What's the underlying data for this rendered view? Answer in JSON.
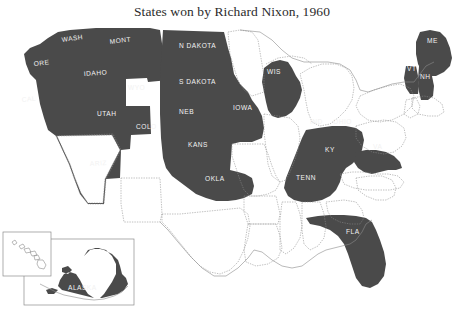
{
  "figure": {
    "title": "States won by Richard Nixon, 1960",
    "background_color": "#ffffff",
    "won_fill_color": "#4a4a4a",
    "lost_fill_color": "#ffffff",
    "border_color": "#8c8c8c",
    "label_color": "#f2f2f2",
    "title_color": "#2b2b2b"
  },
  "map": {
    "type": "choropleth-categorical",
    "subject": "United States presidential election 1960",
    "candidate": "Richard Nixon",
    "year": "1960",
    "legend_shown": false,
    "states_won_labels": [
      {
        "id": "WA",
        "label": "WASH",
        "x": 78,
        "y": 38
      },
      {
        "id": "MT",
        "label": "MONT",
        "x": 128,
        "y": 40
      },
      {
        "id": "OR",
        "label": "ORE",
        "x": 47,
        "y": 64
      },
      {
        "id": "ID",
        "label": "IDAHO",
        "x": 101,
        "y": 74
      },
      {
        "id": "ND",
        "label": "N DAKOTA",
        "x": 200,
        "y": 45
      },
      {
        "id": "SD",
        "label": "S DAKOTA",
        "x": 200,
        "y": 82
      },
      {
        "id": "WY",
        "label": "WYO",
        "x": 144,
        "y": 88
      },
      {
        "id": "CA",
        "label": "CAL",
        "x": 34,
        "y": 99
      },
      {
        "id": "UT",
        "label": "UTAH",
        "x": 113,
        "y": 114
      },
      {
        "id": "CO",
        "label": "COLO",
        "x": 152,
        "y": 127
      },
      {
        "id": "NE",
        "label": "NEB",
        "x": 192,
        "y": 112
      },
      {
        "id": "IA",
        "label": "IOWA",
        "x": 248,
        "y": 108
      },
      {
        "id": "WI",
        "label": "WIS",
        "x": 278,
        "y": 72
      },
      {
        "id": "KS",
        "label": "KANS",
        "x": 203,
        "y": 145
      },
      {
        "id": "AZ",
        "label": "ARIZ",
        "x": 104,
        "y": 164
      },
      {
        "id": "OK",
        "label": "OKLA",
        "x": 220,
        "y": 179
      },
      {
        "id": "IN",
        "label": "IND",
        "x": 320,
        "y": 122
      },
      {
        "id": "OH",
        "label": "OHIO",
        "x": 344,
        "y": 122
      },
      {
        "id": "KY",
        "label": "KY",
        "x": 331,
        "y": 150
      },
      {
        "id": "TN",
        "label": "TENN",
        "x": 311,
        "y": 178
      },
      {
        "id": "VA",
        "label": "VA",
        "x": 380,
        "y": 147
      },
      {
        "id": "ME",
        "label": "ME",
        "x": 433,
        "y": 41
      },
      {
        "id": "VT",
        "label": "VT",
        "x": 414,
        "y": 69
      },
      {
        "id": "NH",
        "label": "NH",
        "x": 427,
        "y": 77
      },
      {
        "id": "FL",
        "label": "FLA",
        "x": 360,
        "y": 232
      },
      {
        "id": "AK",
        "label": "ALASKA",
        "x": 92,
        "y": 288
      }
    ],
    "inset_alaska_label": "ALASKA",
    "inset_hawaii_shown": true
  }
}
